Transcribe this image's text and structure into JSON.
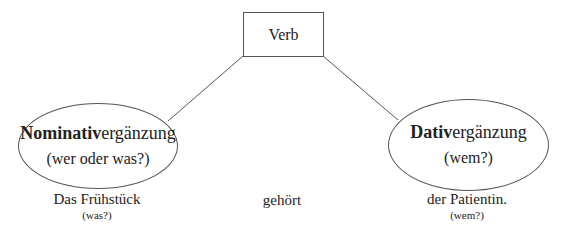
{
  "diagram": {
    "verb_box": {
      "label": "Verb"
    },
    "left_node": {
      "bold": "Nominativ",
      "rest": "ergänzung",
      "question": "(wer oder was?)"
    },
    "right_node": {
      "bold": "Dativ",
      "rest": "ergänzung",
      "question": "(wem?)"
    },
    "example": {
      "left_word": "Das Frühstück",
      "left_question": "(was?)",
      "verb_word": "gehört",
      "right_word": "der Patientin.",
      "right_question": "(wem?)"
    },
    "colors": {
      "line": "#555555",
      "text": "#222222",
      "background": "#ffffff"
    }
  }
}
